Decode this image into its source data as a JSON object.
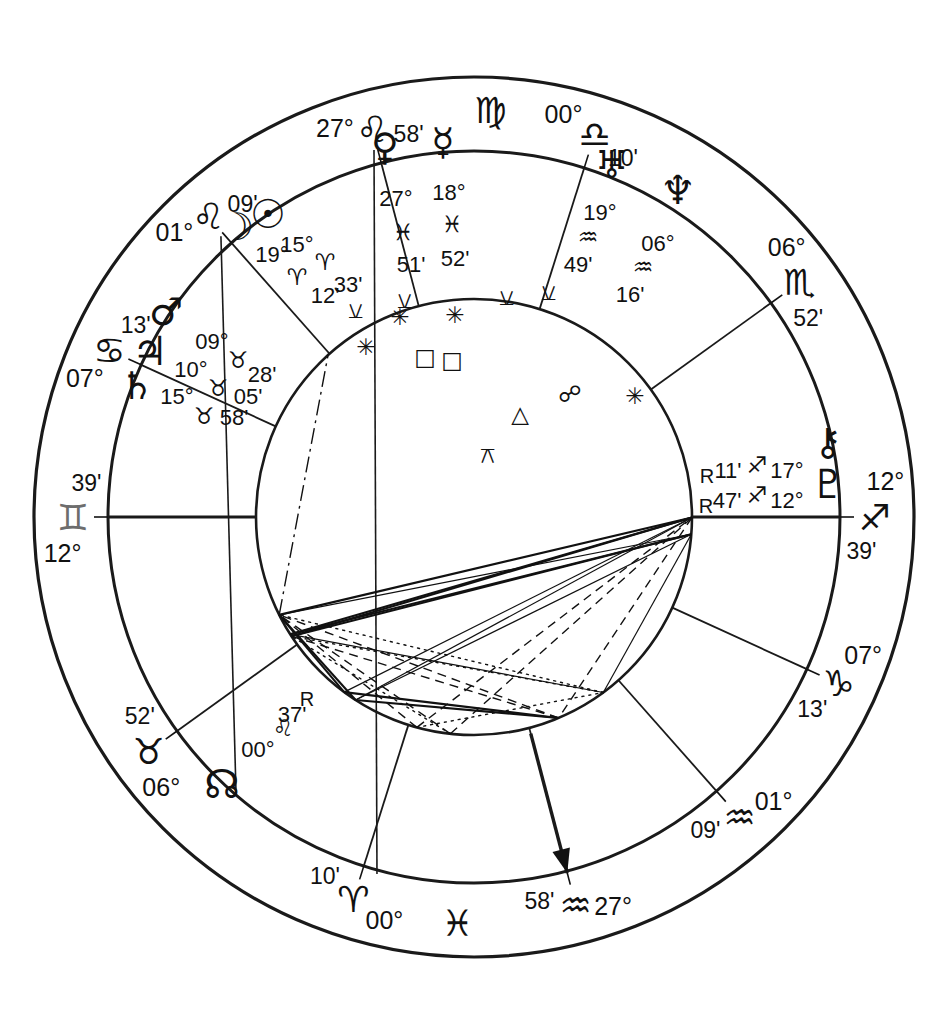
{
  "chart": {
    "kind": "astrology-natal-wheel",
    "house_system_note": "",
    "colors": {
      "ink": "#111111",
      "gray_glyph": "#6d6d6d",
      "background": "#ffffff"
    },
    "zodiac_glyphs": {
      "aries": "♈",
      "taurus": "♉",
      "gemini": "♊",
      "cancer": "♋",
      "leo": "♌",
      "virgo": "♍",
      "libra": "♎",
      "scorpio": "♏",
      "sagittarius": "♐",
      "capricorn": "♑",
      "aquarius": "♒",
      "pisces": "♓"
    },
    "planet_glyphs": {
      "sun": "☉",
      "moon": "☽",
      "mercury": "☿",
      "venus": "♀",
      "mars": "♂",
      "jupiter": "♃",
      "saturn": "♄",
      "uranus": "♅",
      "neptune": "♆",
      "pluto": "♇",
      "chiron": "⚷",
      "north_node": "☊"
    },
    "aspect_glyphs": {
      "conjunction": "☌",
      "opposition": "☍",
      "square": "□",
      "trine": "△",
      "sextile": "✳",
      "semisextile": "⚺",
      "quincunx": "⚻"
    },
    "house_cusps": [
      {
        "house": 1,
        "label": "ASC",
        "degree": "12°",
        "sign": "gemini",
        "sign_name": "Gemini",
        "minute": "39'",
        "lon": 72.65,
        "gray": true
      },
      {
        "house": 2,
        "label": "",
        "degree": "07°",
        "sign": "cancer",
        "sign_name": "Cancer",
        "minute": "13'",
        "lon": 97.22,
        "gray": false
      },
      {
        "house": 3,
        "label": "",
        "degree": "01°",
        "sign": "leo",
        "sign_name": "Leo",
        "minute": "09'",
        "lon": 121.15,
        "gray": false
      },
      {
        "house": 4,
        "label": "IC",
        "degree": "27°",
        "sign": "leo",
        "sign_name": "Leo",
        "minute": "58'",
        "lon": 147.97,
        "gray": false
      },
      {
        "house": 5,
        "label": "",
        "degree": "00°",
        "sign": "libra",
        "sign_name": "Libra",
        "minute": "10'",
        "lon": 180.17,
        "gray": false
      },
      {
        "house": 6,
        "label": "",
        "degree": "06°",
        "sign": "scorpio",
        "sign_name": "Scorpio",
        "minute": "52'",
        "lon": 216.87,
        "gray": false
      },
      {
        "house": 7,
        "label": "DSC",
        "degree": "12°",
        "sign": "sagittarius",
        "sign_name": "Sagittarius",
        "minute": "39'",
        "lon": 252.65,
        "gray": false
      },
      {
        "house": 8,
        "label": "",
        "degree": "07°",
        "sign": "capricorn",
        "sign_name": "Capricorn",
        "minute": "13'",
        "lon": 277.22,
        "gray": false
      },
      {
        "house": 9,
        "label": "",
        "degree": "01°",
        "sign": "aquarius",
        "sign_name": "Aquarius",
        "minute": "09'",
        "lon": 301.15,
        "gray": false
      },
      {
        "house": 10,
        "label": "MC",
        "degree": "27°",
        "sign": "aquarius",
        "sign_name": "Aquarius",
        "minute": "58'",
        "lon": 327.97,
        "gray": false
      },
      {
        "house": 11,
        "label": "",
        "degree": "00°",
        "sign": "aries",
        "sign_name": "Aries",
        "minute": "10'",
        "lon": 0.17,
        "gray": false
      },
      {
        "house": 12,
        "label": "",
        "degree": "06°",
        "sign": "taurus",
        "sign_name": "Taurus",
        "minute": "52'",
        "lon": 36.87,
        "gray": false
      }
    ],
    "standalone_outer_signs": [
      {
        "sign": "pisces",
        "sign_name": "Pisces",
        "lon": 345.0
      },
      {
        "sign": "virgo",
        "sign_name": "Virgo",
        "lon": 165.0
      }
    ],
    "planets": [
      {
        "name": "Sun",
        "key": "sun",
        "degree": "15°",
        "sign": "aries",
        "sign_name": "Aries",
        "minute": "33'",
        "retrograde": false,
        "lon": 15.55
      },
      {
        "name": "Moon",
        "key": "moon",
        "degree": "19°",
        "sign": "aries",
        "sign_name": "Aries",
        "minute": "12'",
        "retrograde": false,
        "lon": 19.2
      },
      {
        "name": "Venus",
        "key": "venus",
        "degree": "27°",
        "sign": "pisces",
        "sign_name": "Pisces",
        "minute": "51'",
        "retrograde": false,
        "lon": 357.85
      },
      {
        "name": "Mercury",
        "key": "mercury",
        "degree": "18°",
        "sign": "pisces",
        "sign_name": "Pisces",
        "minute": "52'",
        "retrograde": false,
        "lon": 348.87
      },
      {
        "name": "Mars",
        "key": "mars",
        "degree": "09°",
        "sign": "taurus",
        "sign_name": "Taurus",
        "minute": "28'",
        "retrograde": false,
        "lon": 39.47
      },
      {
        "name": "Jupiter",
        "key": "jupiter",
        "degree": "10°",
        "sign": "taurus",
        "sign_name": "Taurus",
        "minute": "05'",
        "retrograde": false,
        "lon": 40.08
      },
      {
        "name": "Saturn",
        "key": "saturn",
        "degree": "15°",
        "sign": "taurus",
        "sign_name": "Taurus",
        "minute": "58'",
        "retrograde": false,
        "lon": 45.97
      },
      {
        "name": "Uranus",
        "key": "uranus",
        "degree": "19°",
        "sign": "aquarius",
        "sign_name": "Aquarius",
        "minute": "49'",
        "retrograde": false,
        "lon": 319.82
      },
      {
        "name": "Neptune",
        "key": "neptune",
        "degree": "06°",
        "sign": "aquarius",
        "sign_name": "Aquarius",
        "minute": "16'",
        "retrograde": false,
        "lon": 306.27
      },
      {
        "name": "Chiron",
        "key": "chiron",
        "degree": "17°",
        "sign": "sagittarius",
        "sign_name": "Sagittarius",
        "minute": "11'",
        "retrograde": true,
        "rx": "R",
        "lon": 257.18
      },
      {
        "name": "Pluto",
        "key": "pluto",
        "degree": "12°",
        "sign": "sagittarius",
        "sign_name": "Sagittarius",
        "minute": "47'",
        "retrograde": true,
        "rx": "R",
        "lon": 252.78
      },
      {
        "name": "North Node",
        "key": "north_node",
        "degree": "00°",
        "sign": "leo",
        "sign_name": "Leo",
        "minute": "37'",
        "retrograde": true,
        "rx": "R",
        "lon": 120.62
      }
    ],
    "aspect_markers": [
      {
        "type": "semisextile",
        "glyph": "⚺",
        "x": 355,
        "y": 318
      },
      {
        "type": "semisextile",
        "glyph": "⚺",
        "x": 404,
        "y": 308
      },
      {
        "type": "semisextile",
        "glyph": "⚺",
        "x": 506,
        "y": 305
      },
      {
        "type": "semisextile",
        "glyph": "⚺",
        "x": 548,
        "y": 300
      },
      {
        "type": "sextile",
        "glyph": "✳",
        "x": 400,
        "y": 325
      },
      {
        "type": "sextile",
        "glyph": "✳",
        "x": 455,
        "y": 323
      },
      {
        "type": "sextile",
        "glyph": "✳",
        "x": 366,
        "y": 355
      },
      {
        "type": "square",
        "glyph": "□",
        "x": 425,
        "y": 365
      },
      {
        "type": "square",
        "glyph": "□",
        "x": 452,
        "y": 368
      },
      {
        "type": "opposition",
        "glyph": "☍",
        "x": 570,
        "y": 402
      },
      {
        "type": "sextile",
        "glyph": "✳",
        "x": 635,
        "y": 404
      },
      {
        "type": "trine",
        "glyph": "△",
        "x": 520,
        "y": 422
      },
      {
        "type": "quincunx",
        "glyph": "⚻",
        "x": 487,
        "y": 463
      }
    ],
    "geometry": {
      "cx": 474,
      "cy": 517,
      "r_outer": 440,
      "r_sign_inner": 366,
      "r_house_inner": 218,
      "asc_lon": 72.65
    }
  }
}
